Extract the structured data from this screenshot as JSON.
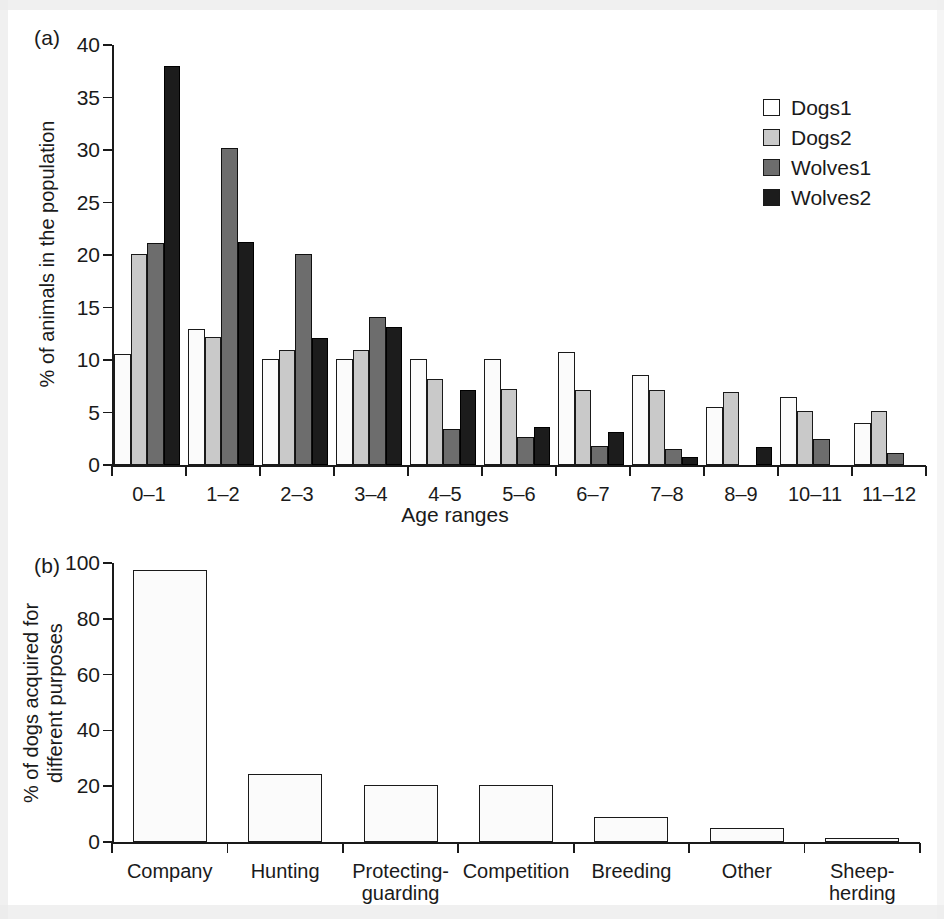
{
  "figure": {
    "panel_a_tag": "(a)",
    "panel_b_tag": "(b)"
  },
  "chart_data": [
    {
      "type": "bar",
      "panel": "(a)",
      "title": "",
      "xlabel": "Age ranges",
      "ylabel": "% of animals in the population",
      "ylim": [
        0,
        40
      ],
      "yticks": [
        0,
        5,
        10,
        15,
        20,
        25,
        30,
        35,
        40
      ],
      "grid": false,
      "legend_position": "top-right",
      "categories": [
        "0–1",
        "1–2",
        "2–3",
        "3–4",
        "4–5",
        "5–6",
        "6–7",
        "7–8",
        "8–9",
        "10–11",
        "11–12"
      ],
      "series": [
        {
          "name": "Dogs1",
          "color": "#ffffff",
          "values": [
            10.6,
            13.0,
            10.1,
            10.1,
            10.1,
            10.1,
            10.8,
            8.6,
            5.5,
            6.5,
            4.0
          ]
        },
        {
          "name": "Dogs2",
          "color": "#c9c9c9",
          "values": [
            20.1,
            12.2,
            11.0,
            11.0,
            8.2,
            7.2,
            7.1,
            7.1,
            7.0,
            5.1,
            5.1
          ]
        },
        {
          "name": "Wolves1",
          "color": "#6d6d6d",
          "values": [
            21.1,
            30.2,
            20.1,
            14.1,
            3.4,
            2.7,
            1.8,
            1.5,
            0.0,
            2.5,
            1.1
          ]
        },
        {
          "name": "Wolves2",
          "color": "#1c1c1c",
          "values": [
            38.0,
            21.2,
            12.1,
            13.1,
            7.1,
            3.6,
            3.1,
            0.8,
            1.7,
            0.0,
            0.0
          ]
        }
      ]
    },
    {
      "type": "bar",
      "panel": "(b)",
      "title": "",
      "xlabel": "",
      "ylabel": "% of dogs acquired for different purposes",
      "ylabel_line1": "% of dogs acquired for",
      "ylabel_line2": "different purposes",
      "ylim": [
        0,
        100
      ],
      "yticks": [
        0,
        20,
        40,
        60,
        80,
        100
      ],
      "grid": false,
      "categories": [
        "Company",
        "Hunting",
        "Protecting-\nguarding",
        "Competition",
        "Breeding",
        "Other",
        "Sheep-\nherding"
      ],
      "category_labels": [
        {
          "line1": "Company",
          "line2": ""
        },
        {
          "line1": "Hunting",
          "line2": ""
        },
        {
          "line1": "Protecting-",
          "line2": "guarding"
        },
        {
          "line1": "Competition",
          "line2": ""
        },
        {
          "line1": "Breeding",
          "line2": ""
        },
        {
          "line1": "Other",
          "line2": ""
        },
        {
          "line1": "Sheep-",
          "line2": "herding"
        }
      ],
      "values": [
        97.5,
        24.5,
        20.3,
        20.3,
        8.8,
        5.0,
        1.5
      ],
      "series": [
        {
          "name": "dogs acquired",
          "color": "#ffffff",
          "values": [
            97.5,
            24.5,
            20.3,
            20.3,
            8.8,
            5.0,
            1.5
          ]
        }
      ]
    }
  ]
}
